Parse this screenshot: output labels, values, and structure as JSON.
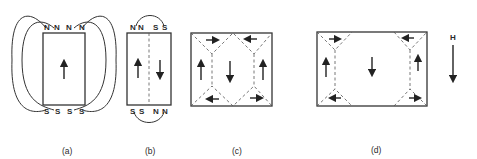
{
  "diagram": {
    "panels": [
      {
        "id": "a",
        "label": "(a)",
        "top_poles": [
          "N",
          "N",
          "N",
          "N"
        ],
        "bottom_poles": [
          "S",
          "S",
          "S",
          "S"
        ],
        "domains": [
          "up"
        ]
      },
      {
        "id": "b",
        "label": "(b)",
        "top_poles": [
          "N",
          "N",
          "S",
          "S"
        ],
        "bottom_poles": [
          "S",
          "S",
          "N",
          "N"
        ],
        "domains": [
          "up",
          "down"
        ]
      },
      {
        "id": "c",
        "label": "(c)",
        "domains": [
          "up",
          "down",
          "up"
        ],
        "closure_domains": [
          "right",
          "left",
          "left",
          "right"
        ]
      },
      {
        "id": "d",
        "label": "(d)",
        "domains": [
          "up",
          "down",
          "up"
        ],
        "closure_domains": [
          "right",
          "left",
          "left",
          "right"
        ]
      }
    ],
    "field": {
      "label": "H",
      "direction": "down"
    }
  }
}
